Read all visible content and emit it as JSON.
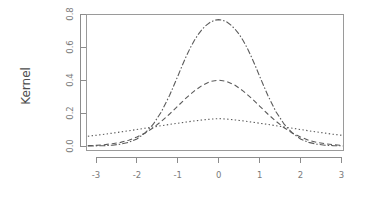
{
  "figure": {
    "background_color": "#ffffff",
    "width": 365,
    "height": 199
  },
  "chart_data": {
    "type": "line",
    "title": "",
    "subtitle": "",
    "xlabel": "",
    "ylabel": "Kernel",
    "xlim": [
      -3.2,
      3.2
    ],
    "ylim": [
      0.0,
      0.82
    ],
    "xticks": [
      -3,
      -2,
      -1,
      0,
      1,
      2,
      3
    ],
    "xtick_labels": [
      "-3",
      "-2",
      "-1",
      "0",
      "1",
      "2",
      "3"
    ],
    "yticks": [
      0.0,
      0.2,
      0.4,
      0.6,
      0.8
    ],
    "ytick_labels": [
      "0.0",
      "0.2",
      "0.4",
      "0.6",
      "0.8"
    ],
    "grid": false,
    "legend": "none",
    "frame": "box",
    "line_color": "#5b5b5b",
    "axis_color": "#8c8c8c",
    "label_color": "#7a7a7a",
    "series": [
      {
        "name": "narrow-bandwidth-kernel",
        "linestyle": "dashdot",
        "dash_pattern": "6,2,1.5,2",
        "peak_value": 0.8,
        "bandwidth": 0.5,
        "x": [
          -3.2,
          -3.0,
          -2.8,
          -2.6,
          -2.4,
          -2.2,
          -2.0,
          -1.8,
          -1.6,
          -1.4,
          -1.2,
          -1.0,
          -0.9,
          -0.8,
          -0.7,
          -0.6,
          -0.5,
          -0.4,
          -0.3,
          -0.2,
          -0.1,
          0.0,
          0.1,
          0.2,
          0.3,
          0.4,
          0.5,
          0.6,
          0.7,
          0.8,
          0.9,
          1.0,
          1.2,
          1.4,
          1.6,
          1.8,
          2.0,
          2.2,
          2.4,
          2.6,
          2.8,
          3.0,
          3.2
        ],
        "y": [
          0.0,
          0.001,
          0.002,
          0.005,
          0.011,
          0.022,
          0.043,
          0.079,
          0.132,
          0.208,
          0.307,
          0.423,
          0.483,
          0.54,
          0.592,
          0.638,
          0.677,
          0.708,
          0.733,
          0.751,
          0.762,
          0.766,
          0.762,
          0.751,
          0.733,
          0.708,
          0.677,
          0.638,
          0.592,
          0.54,
          0.483,
          0.423,
          0.307,
          0.208,
          0.132,
          0.079,
          0.043,
          0.022,
          0.011,
          0.005,
          0.002,
          0.001,
          0.0
        ]
      },
      {
        "name": "medium-bandwidth-kernel",
        "linestyle": "dashed",
        "dash_pattern": "5,3",
        "peak_value": 0.4,
        "bandwidth": 1.0,
        "x": [
          -3.2,
          -3.0,
          -2.8,
          -2.6,
          -2.4,
          -2.2,
          -2.0,
          -1.8,
          -1.6,
          -1.4,
          -1.2,
          -1.0,
          -0.8,
          -0.6,
          -0.4,
          -0.2,
          0.0,
          0.2,
          0.4,
          0.6,
          0.8,
          1.0,
          1.2,
          1.4,
          1.6,
          1.8,
          2.0,
          2.2,
          2.4,
          2.6,
          2.8,
          3.0,
          3.2
        ],
        "y": [
          0.002,
          0.004,
          0.008,
          0.014,
          0.022,
          0.035,
          0.054,
          0.079,
          0.111,
          0.15,
          0.194,
          0.242,
          0.29,
          0.333,
          0.368,
          0.391,
          0.399,
          0.391,
          0.368,
          0.333,
          0.29,
          0.242,
          0.194,
          0.15,
          0.111,
          0.079,
          0.054,
          0.035,
          0.022,
          0.014,
          0.008,
          0.004,
          0.002
        ]
      },
      {
        "name": "wide-bandwidth-kernel",
        "linestyle": "dotted",
        "dash_pattern": "1.4,2.4",
        "peak_value": 0.2,
        "bandwidth": 2.0,
        "x": [
          -3.2,
          -3.0,
          -2.8,
          -2.6,
          -2.4,
          -2.2,
          -2.0,
          -1.8,
          -1.6,
          -1.4,
          -1.2,
          -1.0,
          -0.8,
          -0.6,
          -0.4,
          -0.2,
          0.0,
          0.2,
          0.4,
          0.6,
          0.8,
          1.0,
          1.2,
          1.4,
          1.6,
          1.8,
          2.0,
          2.2,
          2.4,
          2.6,
          2.8,
          3.0,
          3.2
        ],
        "y": [
          0.059,
          0.065,
          0.071,
          0.078,
          0.085,
          0.092,
          0.1,
          0.108,
          0.115,
          0.123,
          0.131,
          0.138,
          0.145,
          0.152,
          0.158,
          0.163,
          0.166,
          0.163,
          0.158,
          0.152,
          0.145,
          0.138,
          0.131,
          0.123,
          0.115,
          0.108,
          0.1,
          0.092,
          0.085,
          0.078,
          0.071,
          0.065,
          0.059
        ]
      }
    ]
  }
}
